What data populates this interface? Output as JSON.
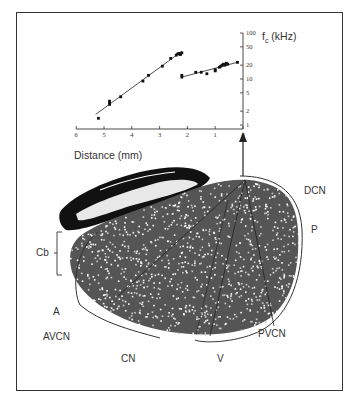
{
  "figure": {
    "labels": {
      "cb": "Cb",
      "a": "A",
      "avcn": "AVCN",
      "cn": "CN",
      "v": "V",
      "pvcn": "PVCN",
      "p": "P",
      "dcn": "DCN"
    }
  },
  "chart_data": {
    "type": "scatter",
    "title": "",
    "xlabel": "Distance (mm)",
    "ylabel": "f",
    "ylabel_sub": "c",
    "ylabel_unit": "(kHz)",
    "x_reversed": true,
    "xlim": [
      6,
      0
    ],
    "ylim": [
      1,
      100
    ],
    "y_scale": "log",
    "x_ticks": [
      6,
      5,
      4,
      3,
      2,
      1,
      0
    ],
    "y_ticks": [
      1,
      2,
      5,
      10,
      20,
      50,
      100
    ],
    "grid": false,
    "series": [
      {
        "name": "segment-1",
        "points": [
          [
            5.2,
            1.4
          ],
          [
            4.8,
            2.8
          ],
          [
            4.8,
            3.1
          ],
          [
            4.8,
            3.3
          ],
          [
            4.4,
            4.1
          ],
          [
            3.6,
            9
          ],
          [
            3.4,
            12
          ],
          [
            2.9,
            19
          ],
          [
            2.6,
            28
          ],
          [
            2.4,
            33
          ],
          [
            2.35,
            35
          ],
          [
            2.3,
            36
          ],
          [
            2.25,
            34
          ],
          [
            2.2,
            37
          ]
        ],
        "fit": [
          [
            5.3,
            1.7
          ],
          [
            2.2,
            40
          ]
        ]
      },
      {
        "name": "segment-2",
        "points": [
          [
            2.2,
            11
          ],
          [
            2.2,
            12
          ],
          [
            1.7,
            14
          ],
          [
            1.5,
            14
          ],
          [
            1.3,
            13
          ],
          [
            1.0,
            15
          ],
          [
            1.0,
            16
          ],
          [
            0.85,
            18
          ],
          [
            0.8,
            19
          ],
          [
            0.75,
            20
          ],
          [
            0.7,
            21
          ],
          [
            0.65,
            20
          ],
          [
            0.6,
            22
          ],
          [
            0.55,
            21
          ],
          [
            0.2,
            23
          ]
        ],
        "fit": [
          [
            2.2,
            11
          ],
          [
            0.15,
            23.5
          ]
        ]
      }
    ]
  }
}
